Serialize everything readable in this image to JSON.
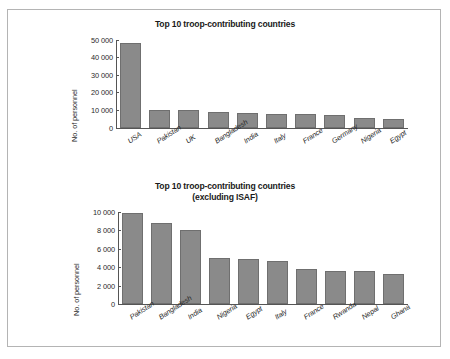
{
  "figure": {
    "border_color": "#b4b4b4",
    "bar_color": "#8a8a8a",
    "axis_color": "#555555"
  },
  "chart_data": [
    {
      "type": "bar",
      "id": "top",
      "title": "Top 10 troop-contributing countries",
      "subtitle": "",
      "xlabel": "",
      "ylabel": "No. of personnel",
      "ylim": [
        0,
        50000
      ],
      "grid": false,
      "legend": "none",
      "ytick_labels": [
        "0",
        "10 000",
        "20 000",
        "30 000",
        "40 000",
        "50 000"
      ],
      "ytick_values": [
        0,
        10000,
        20000,
        30000,
        40000,
        50000
      ],
      "categories": [
        "USA",
        "Pakistan",
        "UK",
        "Bangladesh",
        "India",
        "Italy",
        "France",
        "Germany",
        "Nigeria",
        "Egypt"
      ],
      "values": [
        48000,
        9900,
        9700,
        8800,
        8100,
        7800,
        7600,
        7100,
        5200,
        5100
      ]
    },
    {
      "type": "bar",
      "id": "bottom",
      "title": "Top 10 troop-contributing countries",
      "subtitle": "(excluding ISAF)",
      "xlabel": "",
      "ylabel": "No. of personnel",
      "ylim": [
        0,
        10000
      ],
      "grid": false,
      "legend": "none",
      "ytick_labels": [
        "0",
        "2 000",
        "4 000",
        "6 000",
        "8 000",
        "10 000"
      ],
      "ytick_values": [
        0,
        2000,
        4000,
        6000,
        8000,
        10000
      ],
      "categories": [
        "Pakistan",
        "Bangladesh",
        "India",
        "Nigeria",
        "Egypt",
        "Italy",
        "France",
        "Rwanda",
        "Nepal",
        "Ghana"
      ],
      "values": [
        9900,
        8800,
        8050,
        5000,
        4900,
        4650,
        3800,
        3600,
        3550,
        3250
      ]
    }
  ]
}
